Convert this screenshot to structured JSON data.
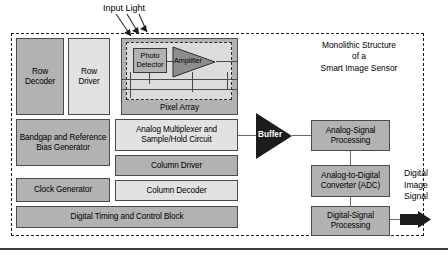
{
  "diagram": {
    "title_caption": {
      "line1": "Monolithic Structure",
      "line2": "of a",
      "line3": "Smart Image Sensor"
    },
    "input_label": "Input Light",
    "output_label": {
      "line1": "Digital",
      "line2": "Image",
      "line3": "Signal"
    }
  },
  "left_column": {
    "row_decoder": "Row Decoder",
    "row_driver": "Row Driver",
    "bandgap": "Bandgap and Reference Bias Generator",
    "clock_generator": "Clock Generator"
  },
  "center_column": {
    "pixel_array": "Pixel Array",
    "photo_detector": "Photo Detector",
    "amplifier": "Amplifier",
    "analog_mux": "Analog Multiplexer and Sample/Hold Circuit",
    "column_driver": "Column Driver",
    "column_decoder": "Column Decoder"
  },
  "bottom_bar": {
    "digital_timing": "Digital Timing and Control Block"
  },
  "signal_chain": {
    "buffer": "Buffer",
    "analog_signal_processing": "Analog-Signal Processing",
    "adc": "Analog-to-Digital Converter (ADC)",
    "digital_signal_processing": "Digital-Signal Processing"
  },
  "colors": {
    "block_dark": "#b2b2b2",
    "block_light": "#e2e2e2",
    "block_border": "#4a4a4a",
    "buffer_fill": "#1c1c1c",
    "boundary": "#1a1a1a",
    "background": "#ffffff"
  }
}
